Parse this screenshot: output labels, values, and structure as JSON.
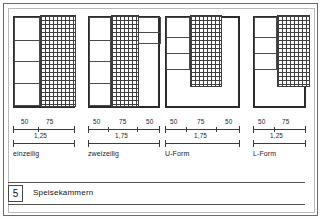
{
  "sheet": {
    "number": "5",
    "title": "Speisekammern"
  },
  "figures": [
    {
      "id": "einzeilig",
      "caption": "einzeilig",
      "dimensions": {
        "segments": [
          "50",
          "75"
        ],
        "total": "1,25"
      }
    },
    {
      "id": "zweizeilig",
      "caption": "zweizeilig",
      "dimensions": {
        "segments": [
          "50",
          "75",
          "50"
        ],
        "total": "1,75"
      }
    },
    {
      "id": "u-form",
      "caption": "U-Form",
      "dimensions": {
        "segments": [
          "50",
          "75",
          "50"
        ],
        "total": "1,75"
      }
    },
    {
      "id": "l-form",
      "caption": "L-Form",
      "dimensions": {
        "segments": [
          "50",
          "75"
        ],
        "total": "1,25"
      }
    }
  ]
}
